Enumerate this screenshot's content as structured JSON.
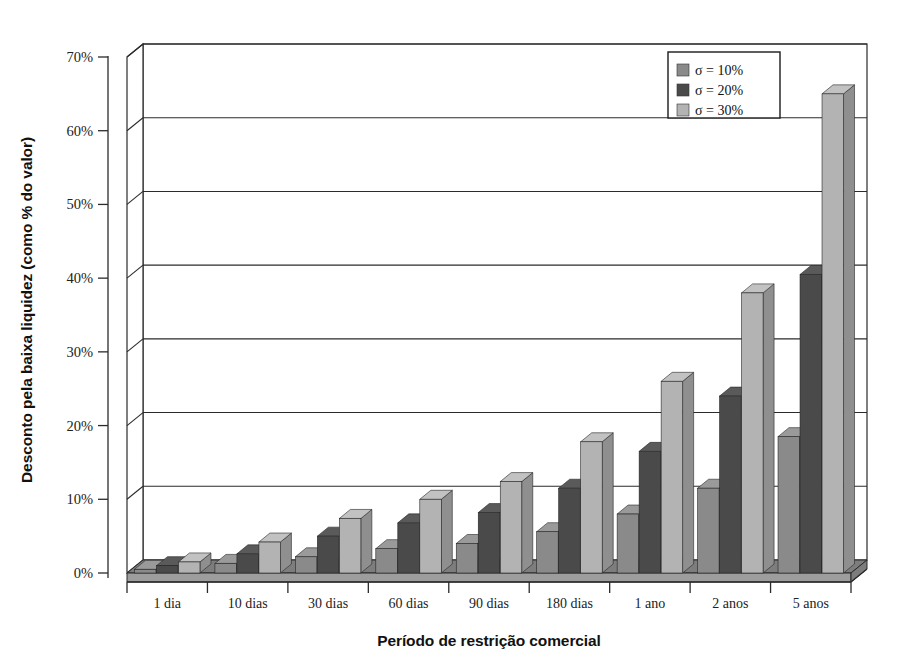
{
  "chart_data": {
    "type": "bar",
    "title": "",
    "xlabel": "Período de restrição comercial",
    "ylabel": "Desconto pela baixa liquidez (como % do valor)",
    "categories": [
      "1 dia",
      "10 dias",
      "30 dias",
      "60 dias",
      "90 dias",
      "180 dias",
      "1 ano",
      "2 anos",
      "5 anos"
    ],
    "series": [
      {
        "name": "σ = 10%",
        "color": "#8a8a8a",
        "values": [
          0.5,
          1.3,
          2.2,
          3.3,
          4.0,
          5.6,
          8.0,
          11.5,
          18.5
        ]
      },
      {
        "name": "σ = 20%",
        "color": "#4a4a4a",
        "values": [
          1.0,
          2.6,
          5.0,
          6.8,
          8.2,
          11.5,
          16.5,
          24.0,
          40.5
        ]
      },
      {
        "name": "σ = 30%",
        "color": "#b3b3b3",
        "values": [
          1.5,
          4.2,
          7.4,
          10.0,
          12.4,
          17.8,
          26.0,
          38.0,
          65.0
        ]
      }
    ],
    "ylim": [
      0,
      70
    ],
    "yticks": [
      0,
      10,
      20,
      30,
      40,
      50,
      60,
      70
    ],
    "ytick_labels": [
      "0%",
      "10%",
      "20%",
      "30%",
      "40%",
      "50%",
      "60%",
      "70%"
    ],
    "grid": true,
    "legend_position": "top-right",
    "style": "3d-column"
  },
  "legend": {
    "entries": [
      {
        "label": "σ = 10%",
        "swatch": "#8a8a8a"
      },
      {
        "label": "σ = 20%",
        "swatch": "#4a4a4a"
      },
      {
        "label": "σ = 30%",
        "swatch": "#b3b3b3"
      }
    ]
  },
  "colors": {
    "series_10": "#8a8a8a",
    "series_20": "#4a4a4a",
    "series_30": "#b3b3b3",
    "side_10": "#6e6e6e",
    "side_20": "#333333",
    "side_30": "#8f8f8f",
    "top_10": "#9a9a9a",
    "top_20": "#5a5a5a",
    "top_30": "#c2c2c2",
    "floor": "#7d7d7d",
    "floor_side": "#9d9d9d",
    "axis": "#2b2b2b",
    "background": "#ffffff"
  }
}
